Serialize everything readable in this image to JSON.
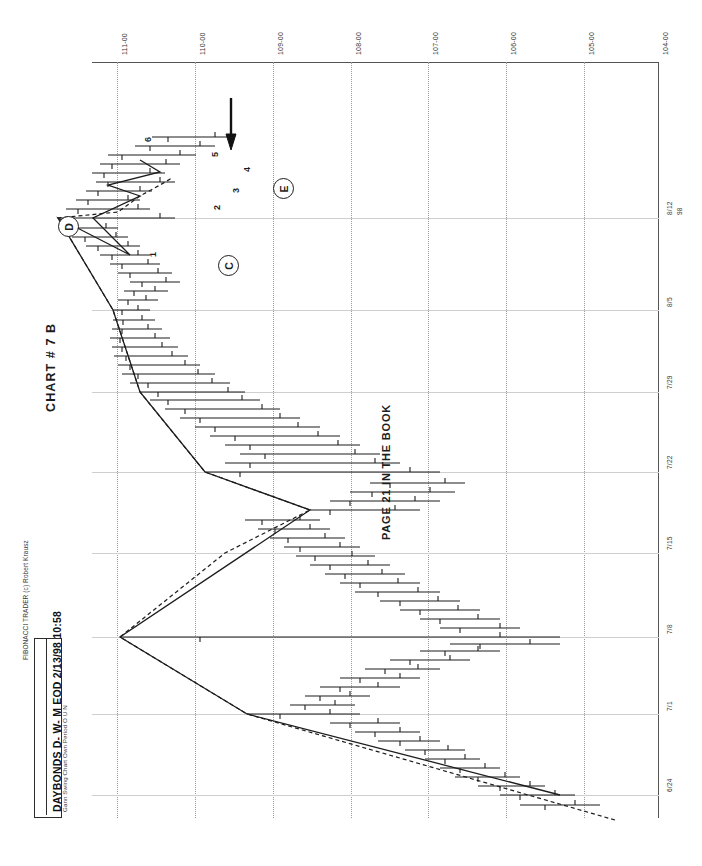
{
  "app": {
    "credit": "FIBONACCI TRADER (c) Robert Krausz",
    "title": "DAYBONDS D- W- M EOD  2/13/98 10:58",
    "subtitle": "Gann Swing Chart Own Period O U N"
  },
  "annotations": {
    "chart_title": "CHART # 7  B",
    "book_note": "PAGE 21 IN THE BOOK",
    "markers": [
      {
        "label": "E",
        "x": 273,
        "y": 178
      },
      {
        "label": "D",
        "x": 58,
        "y": 216
      },
      {
        "label": "C",
        "x": 218,
        "y": 255
      }
    ],
    "swing_numbers": [
      {
        "label": "1",
        "x": 148,
        "y": 257
      },
      {
        "label": "2",
        "x": 212,
        "y": 210
      },
      {
        "label": "3",
        "x": 231,
        "y": 193
      },
      {
        "label": "4",
        "x": 242,
        "y": 172
      },
      {
        "label": "5",
        "x": 210,
        "y": 157
      },
      {
        "label": "6",
        "x": 143,
        "y": 142
      }
    ],
    "arrow": {
      "name": "down-arrow-marker",
      "x": 231,
      "y": 120
    }
  },
  "chart_data": {
    "type": "line",
    "orientation": "rotated-90-ccw",
    "xlabel": "Date",
    "ylabel": "Price",
    "grid": true,
    "legend": "none",
    "price_axis": {
      "name": "price-axis",
      "ticks": [
        "111-00",
        "110-00",
        "109-00",
        "108-00",
        "107-00",
        "106-00",
        "105-00",
        "104-00"
      ],
      "values": [
        111.0,
        110.0,
        109.0,
        108.0,
        107.0,
        106.0,
        105.0,
        104.0
      ],
      "range": [
        104.0,
        111.0
      ],
      "pixel_positions": [
        117,
        195,
        273,
        351,
        428,
        506,
        584,
        658
      ]
    },
    "date_axis": {
      "name": "date-axis",
      "ticks": [
        "8/12",
        "8/5",
        "7/29",
        "7/22",
        "7/15",
        "7/8",
        "7/1",
        "6/24"
      ],
      "year": "98",
      "pixel_positions": [
        218,
        310,
        392,
        472,
        553,
        637,
        714,
        795
      ],
      "range": [
        "6/24/98",
        "8/12/98"
      ]
    },
    "series": [
      {
        "name": "gann-swing-line",
        "style": "solid",
        "points": [
          [
            795,
            560
          ],
          [
            714,
            247
          ],
          [
            637,
            120
          ],
          [
            510,
            310
          ],
          [
            472,
            205
          ],
          [
            392,
            140
          ],
          [
            310,
            113
          ],
          [
            218,
            58
          ],
          [
            255,
            130
          ],
          [
            218,
            93
          ],
          [
            196,
            140
          ],
          [
            185,
            108
          ],
          [
            172,
            160
          ],
          [
            160,
            140
          ]
        ]
      },
      {
        "name": "gann-swing-dashed-line",
        "style": "dashed",
        "points": [
          [
            820,
            615
          ],
          [
            714,
            247
          ],
          [
            637,
            120
          ],
          [
            553,
            225
          ],
          [
            510,
            310
          ],
          [
            472,
            205
          ],
          [
            392,
            140
          ],
          [
            310,
            113
          ],
          [
            218,
            58
          ],
          [
            212,
            118
          ],
          [
            196,
            140
          ],
          [
            185,
            160
          ],
          [
            178,
            172
          ]
        ]
      }
    ],
    "bars_note": "OHLC price bars drawn as horizontal bars with left/right ticks",
    "bars": [
      {
        "d": 805,
        "lo": 520,
        "hi": 600,
        "o": 545,
        "c": 575
      },
      {
        "d": 795,
        "lo": 500,
        "hi": 575,
        "o": 520,
        "c": 555
      },
      {
        "d": 786,
        "lo": 478,
        "hi": 545,
        "o": 500,
        "c": 530
      },
      {
        "d": 777,
        "lo": 455,
        "hi": 520,
        "o": 478,
        "c": 505
      },
      {
        "d": 768,
        "lo": 440,
        "hi": 500,
        "o": 460,
        "c": 485
      },
      {
        "d": 759,
        "lo": 425,
        "hi": 480,
        "o": 445,
        "c": 465
      },
      {
        "d": 750,
        "lo": 405,
        "hi": 465,
        "o": 425,
        "c": 448
      },
      {
        "d": 741,
        "lo": 378,
        "hi": 440,
        "o": 400,
        "c": 420
      },
      {
        "d": 732,
        "lo": 355,
        "hi": 420,
        "o": 375,
        "c": 400
      },
      {
        "d": 723,
        "lo": 330,
        "hi": 400,
        "o": 350,
        "c": 378
      },
      {
        "d": 714,
        "lo": 247,
        "hi": 360,
        "o": 280,
        "c": 330
      },
      {
        "d": 705,
        "lo": 290,
        "hi": 355,
        "o": 305,
        "c": 335
      },
      {
        "d": 696,
        "lo": 305,
        "hi": 370,
        "o": 320,
        "c": 350
      },
      {
        "d": 687,
        "lo": 320,
        "hi": 400,
        "o": 340,
        "c": 378
      },
      {
        "d": 678,
        "lo": 340,
        "hi": 420,
        "o": 360,
        "c": 400
      },
      {
        "d": 669,
        "lo": 365,
        "hi": 440,
        "o": 385,
        "c": 418
      },
      {
        "d": 660,
        "lo": 390,
        "hi": 470,
        "o": 410,
        "c": 450
      },
      {
        "d": 651,
        "lo": 420,
        "hi": 500,
        "o": 445,
        "c": 478
      },
      {
        "d": 644,
        "lo": 450,
        "hi": 560,
        "o": 480,
        "c": 530
      },
      {
        "d": 637,
        "lo": 120,
        "hi": 560,
        "o": 200,
        "c": 500
      },
      {
        "d": 628,
        "lo": 440,
        "hi": 520,
        "o": 460,
        "c": 500
      },
      {
        "d": 619,
        "lo": 420,
        "hi": 500,
        "o": 440,
        "c": 478
      },
      {
        "d": 610,
        "lo": 400,
        "hi": 480,
        "o": 420,
        "c": 458
      },
      {
        "d": 601,
        "lo": 380,
        "hi": 460,
        "o": 400,
        "c": 438
      },
      {
        "d": 592,
        "lo": 355,
        "hi": 440,
        "o": 378,
        "c": 418
      },
      {
        "d": 583,
        "lo": 340,
        "hi": 420,
        "o": 360,
        "c": 398
      },
      {
        "d": 574,
        "lo": 325,
        "hi": 405,
        "o": 345,
        "c": 382
      },
      {
        "d": 565,
        "lo": 310,
        "hi": 390,
        "o": 330,
        "c": 368
      },
      {
        "d": 556,
        "lo": 296,
        "hi": 375,
        "o": 315,
        "c": 352
      },
      {
        "d": 547,
        "lo": 284,
        "hi": 360,
        "o": 300,
        "c": 340
      },
      {
        "d": 538,
        "lo": 270,
        "hi": 345,
        "o": 288,
        "c": 325
      },
      {
        "d": 529,
        "lo": 258,
        "hi": 330,
        "o": 275,
        "c": 310
      },
      {
        "d": 520,
        "lo": 245,
        "hi": 320,
        "o": 262,
        "c": 300
      },
      {
        "d": 510,
        "lo": 310,
        "hi": 420,
        "o": 330,
        "c": 395
      },
      {
        "d": 501,
        "lo": 330,
        "hi": 440,
        "o": 350,
        "c": 415
      },
      {
        "d": 492,
        "lo": 350,
        "hi": 455,
        "o": 372,
        "c": 430
      },
      {
        "d": 483,
        "lo": 370,
        "hi": 465,
        "o": 390,
        "c": 445
      },
      {
        "d": 472,
        "lo": 205,
        "hi": 440,
        "o": 240,
        "c": 410
      },
      {
        "d": 463,
        "lo": 225,
        "hi": 400,
        "o": 250,
        "c": 375
      },
      {
        "d": 454,
        "lo": 240,
        "hi": 380,
        "o": 265,
        "c": 355
      },
      {
        "d": 445,
        "lo": 225,
        "hi": 360,
        "o": 250,
        "c": 338
      },
      {
        "d": 436,
        "lo": 210,
        "hi": 340,
        "o": 235,
        "c": 318
      },
      {
        "d": 427,
        "lo": 195,
        "hi": 320,
        "o": 215,
        "c": 298
      },
      {
        "d": 418,
        "lo": 180,
        "hi": 300,
        "o": 200,
        "c": 280
      },
      {
        "d": 409,
        "lo": 165,
        "hi": 280,
        "o": 185,
        "c": 262
      },
      {
        "d": 400,
        "lo": 150,
        "hi": 260,
        "o": 168,
        "c": 242
      },
      {
        "d": 392,
        "lo": 140,
        "hi": 245,
        "o": 158,
        "c": 228
      },
      {
        "d": 383,
        "lo": 130,
        "hi": 230,
        "o": 148,
        "c": 212
      },
      {
        "d": 374,
        "lo": 122,
        "hi": 215,
        "o": 138,
        "c": 198
      },
      {
        "d": 365,
        "lo": 118,
        "hi": 200,
        "o": 130,
        "c": 185
      },
      {
        "d": 356,
        "lo": 114,
        "hi": 188,
        "o": 126,
        "c": 172
      },
      {
        "d": 347,
        "lo": 112,
        "hi": 178,
        "o": 122,
        "c": 162
      },
      {
        "d": 338,
        "lo": 110,
        "hi": 170,
        "o": 120,
        "c": 155
      },
      {
        "d": 329,
        "lo": 112,
        "hi": 162,
        "o": 122,
        "c": 148
      },
      {
        "d": 320,
        "lo": 113,
        "hi": 155,
        "o": 123,
        "c": 142
      },
      {
        "d": 310,
        "lo": 113,
        "hi": 150,
        "o": 122,
        "c": 138
      },
      {
        "d": 300,
        "lo": 118,
        "hi": 158,
        "o": 128,
        "c": 146
      },
      {
        "d": 291,
        "lo": 124,
        "hi": 168,
        "o": 134,
        "c": 155
      },
      {
        "d": 282,
        "lo": 130,
        "hi": 180,
        "o": 142,
        "c": 166
      },
      {
        "d": 273,
        "lo": 118,
        "hi": 172,
        "o": 130,
        "c": 158
      },
      {
        "d": 264,
        "lo": 110,
        "hi": 160,
        "o": 122,
        "c": 148
      },
      {
        "d": 255,
        "lo": 100,
        "hi": 150,
        "o": 112,
        "c": 138
      },
      {
        "d": 246,
        "lo": 86,
        "hi": 140,
        "o": 98,
        "c": 128
      },
      {
        "d": 237,
        "lo": 72,
        "hi": 128,
        "o": 85,
        "c": 116
      },
      {
        "d": 228,
        "lo": 62,
        "hi": 118,
        "o": 74,
        "c": 106
      },
      {
        "d": 218,
        "lo": 58,
        "hi": 175,
        "o": 70,
        "c": 160
      },
      {
        "d": 209,
        "lo": 66,
        "hi": 150,
        "o": 78,
        "c": 138
      },
      {
        "d": 200,
        "lo": 76,
        "hi": 140,
        "o": 88,
        "c": 128
      },
      {
        "d": 191,
        "lo": 86,
        "hi": 152,
        "o": 98,
        "c": 140
      },
      {
        "d": 182,
        "lo": 96,
        "hi": 175,
        "o": 108,
        "c": 160
      },
      {
        "d": 173,
        "lo": 92,
        "hi": 165,
        "o": 104,
        "c": 150
      },
      {
        "d": 164,
        "lo": 100,
        "hi": 180,
        "o": 112,
        "c": 166
      },
      {
        "d": 155,
        "lo": 108,
        "hi": 196,
        "o": 122,
        "c": 180
      },
      {
        "d": 146,
        "lo": 135,
        "hi": 215,
        "o": 150,
        "c": 200
      },
      {
        "d": 137,
        "lo": 152,
        "hi": 230,
        "o": 168,
        "c": 215
      }
    ]
  }
}
